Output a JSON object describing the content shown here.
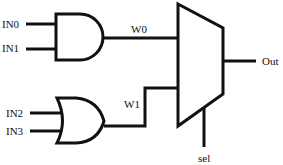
{
  "diagram": {
    "type": "logic-circuit",
    "colors": {
      "stroke": "#111111",
      "background": "#ffffff"
    },
    "inputs": [
      {
        "id": "in0",
        "label": "IN0"
      },
      {
        "id": "in1",
        "label": "IN1"
      },
      {
        "id": "in2",
        "label": "IN2"
      },
      {
        "id": "in3",
        "label": "IN3"
      }
    ],
    "gates": [
      {
        "id": "and-gate",
        "type": "AND",
        "inputs": [
          "IN0",
          "IN1"
        ],
        "output": "W0"
      },
      {
        "id": "or-gate",
        "type": "OR",
        "inputs": [
          "IN2",
          "IN3"
        ],
        "output": "W1"
      }
    ],
    "wires": [
      {
        "id": "w0",
        "label": "W0"
      },
      {
        "id": "w1",
        "label": "W1"
      }
    ],
    "mux": {
      "type": "MUX 2:1",
      "inputs": [
        "W0",
        "W1"
      ],
      "select": {
        "label": "sel"
      },
      "output": {
        "label": "Out"
      }
    }
  }
}
